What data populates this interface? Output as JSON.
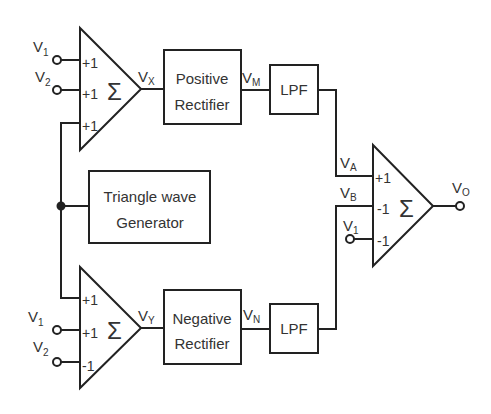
{
  "diagram": {
    "type": "block-diagram",
    "colors": {
      "line": "#222222",
      "text": "#333333",
      "background": "#ffffff"
    },
    "summers": {
      "top": {
        "symbol": "Σ",
        "coefficients": [
          "+1",
          "+1",
          "+1"
        ],
        "inputs": [
          "V1",
          "V2",
          "triangle"
        ],
        "output": "VX"
      },
      "bottom": {
        "symbol": "Σ",
        "coefficients": [
          "+1",
          "+1",
          "-1"
        ],
        "inputs": [
          "triangle",
          "V1",
          "V2"
        ],
        "output": "VY"
      },
      "right": {
        "symbol": "Σ",
        "coefficients": [
          "+1",
          "-1",
          "-1"
        ],
        "inputs": [
          "VA",
          "VB",
          "V1"
        ],
        "output": "VO"
      }
    },
    "blocks": {
      "positive_rectifier": {
        "line1": "Positive",
        "line2": "Rectifier"
      },
      "negative_rectifier": {
        "line1": "Negative",
        "line2": "Rectifier"
      },
      "lpf_top": {
        "label": "LPF"
      },
      "lpf_bottom": {
        "label": "LPF"
      },
      "triangle_gen": {
        "line1": "Triangle wave",
        "line2": "Generator"
      }
    },
    "signals": {
      "v1_top": {
        "main": "V",
        "sub": "1"
      },
      "v2_top": {
        "main": "V",
        "sub": "2"
      },
      "v1_bottom": {
        "main": "V",
        "sub": "1"
      },
      "v2_bottom": {
        "main": "V",
        "sub": "2"
      },
      "v1_right": {
        "main": "V",
        "sub": "1"
      },
      "vx": {
        "main": "V",
        "sub": "X"
      },
      "vy": {
        "main": "V",
        "sub": "Y"
      },
      "vm": {
        "main": "V",
        "sub": "M"
      },
      "vn": {
        "main": "V",
        "sub": "N"
      },
      "va": {
        "main": "V",
        "sub": "A"
      },
      "vb": {
        "main": "V",
        "sub": "B"
      },
      "vo": {
        "main": "V",
        "sub": "O"
      }
    }
  }
}
